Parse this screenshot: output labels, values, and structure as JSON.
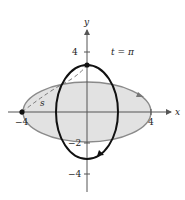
{
  "figure": {
    "parameter_label": "t = π",
    "arc_label": "s",
    "axes": {
      "x_label": "x",
      "y_label": "y",
      "x_ticks": [
        "−4",
        "4"
      ],
      "y_ticks": [
        "4",
        "−2",
        "−4"
      ]
    },
    "curves": [
      {
        "name": "gray-ellipse",
        "semi_x": 4,
        "semi_y": 2,
        "fill": "#e2e2e2",
        "stroke": "#8a8a8a"
      },
      {
        "name": "black-ellipse",
        "semi_x": 2,
        "semi_y": 3,
        "stroke": "#111111"
      }
    ],
    "points": [
      {
        "name": "point-on-gray-ellipse",
        "x": -4,
        "y": 0
      },
      {
        "name": "point-on-black-ellipse",
        "x": 0,
        "y": 3
      }
    ],
    "colors": {
      "axis": "#555555",
      "gray_fill": "#e2e2e2",
      "gray_stroke": "#8a8a8a",
      "black_curve": "#111111",
      "dashed": "#777777"
    }
  }
}
